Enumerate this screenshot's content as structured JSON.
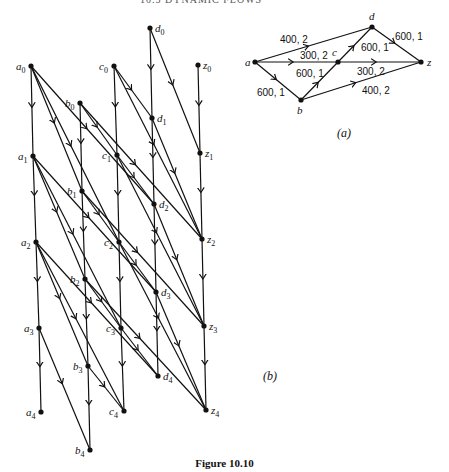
{
  "header": {
    "running_head": "10.5  DYNAMIC FLOWS"
  },
  "caption": "Figure 10.10",
  "panel_a": {
    "label": "(a)",
    "nodes": [
      {
        "id": "a",
        "label": "a",
        "x": 255,
        "y": 62,
        "lx": -10,
        "ly": 4
      },
      {
        "id": "b",
        "label": "b",
        "x": 301,
        "y": 100,
        "lx": -4,
        "ly": 14
      },
      {
        "id": "c",
        "label": "c",
        "x": 338,
        "y": 62,
        "lx": -6,
        "ly": -6
      },
      {
        "id": "d",
        "label": "d",
        "x": 372,
        "y": 27,
        "lx": -3,
        "ly": -7
      },
      {
        "id": "z",
        "label": "z",
        "x": 421,
        "y": 62,
        "lx": 6,
        "ly": 4
      }
    ],
    "edges": [
      {
        "from": "a",
        "to": "d",
        "label": "400, 2",
        "lx": 280,
        "ly": 43
      },
      {
        "from": "a",
        "to": "c",
        "label": "300, 2",
        "lx": 300,
        "ly": 59
      },
      {
        "from": "a",
        "to": "b",
        "label": "600, 1",
        "lx": 257,
        "ly": 96
      },
      {
        "from": "b",
        "to": "c",
        "label": "600, 1",
        "lx": 296,
        "ly": 77
      },
      {
        "from": "c",
        "to": "d",
        "label": "600, 1",
        "lx": 361,
        "ly": 51
      },
      {
        "from": "d",
        "to": "z",
        "label": "600, 1",
        "lx": 395,
        "ly": 40
      },
      {
        "from": "c",
        "to": "z",
        "label": "300, 2",
        "lx": 357,
        "ly": 75
      },
      {
        "from": "b",
        "to": "z",
        "label": "400, 2",
        "lx": 362,
        "ly": 94
      }
    ]
  },
  "panel_b": {
    "label": "(b)",
    "nodes": [
      {
        "id": "a0",
        "base": "a",
        "t": "0",
        "x": 31,
        "y": 66
      },
      {
        "id": "a1",
        "base": "a",
        "t": "1",
        "x": 33,
        "y": 156
      },
      {
        "id": "a2",
        "base": "a",
        "t": "2",
        "x": 36,
        "y": 242
      },
      {
        "id": "a3",
        "base": "a",
        "t": "3",
        "x": 39,
        "y": 328
      },
      {
        "id": "a4",
        "base": "a",
        "t": "4",
        "x": 41,
        "y": 412
      },
      {
        "id": "b0",
        "base": "b",
        "t": "0",
        "x": 80,
        "y": 103
      },
      {
        "id": "b1",
        "base": "b",
        "t": "1",
        "x": 82,
        "y": 191
      },
      {
        "id": "b2",
        "base": "b",
        "t": "2",
        "x": 85,
        "y": 279
      },
      {
        "id": "b3",
        "base": "b",
        "t": "3",
        "x": 88,
        "y": 366
      },
      {
        "id": "b4",
        "base": "b",
        "t": "4",
        "x": 90,
        "y": 450
      },
      {
        "id": "c0",
        "base": "c",
        "t": "0",
        "x": 114,
        "y": 66
      },
      {
        "id": "c1",
        "base": "c",
        "t": "1",
        "x": 117,
        "y": 155
      },
      {
        "id": "c2",
        "base": "c",
        "t": "2",
        "x": 119,
        "y": 242
      },
      {
        "id": "c3",
        "base": "c",
        "t": "3",
        "x": 121,
        "y": 328
      },
      {
        "id": "c4",
        "base": "c",
        "t": "4",
        "x": 124,
        "y": 411
      },
      {
        "id": "d0",
        "base": "d",
        "t": "0",
        "x": 150,
        "y": 28
      },
      {
        "id": "d1",
        "base": "d",
        "t": "1",
        "x": 152,
        "y": 118
      },
      {
        "id": "d2",
        "base": "d",
        "t": "2",
        "x": 154,
        "y": 204
      },
      {
        "id": "d3",
        "base": "d",
        "t": "3",
        "x": 156,
        "y": 292
      },
      {
        "id": "d4",
        "base": "d",
        "t": "4",
        "x": 158,
        "y": 376
      },
      {
        "id": "z0",
        "base": "z",
        "t": "0",
        "x": 198,
        "y": 65
      },
      {
        "id": "z1",
        "base": "z",
        "t": "1",
        "x": 200,
        "y": 153
      },
      {
        "id": "z2",
        "base": "z",
        "t": "2",
        "x": 202,
        "y": 239
      },
      {
        "id": "z3",
        "base": "z",
        "t": "3",
        "x": 204,
        "y": 326
      },
      {
        "id": "z4",
        "base": "z",
        "t": "4",
        "x": 206,
        "y": 410
      }
    ],
    "holdover_edges": [
      [
        "a0",
        "a1"
      ],
      [
        "a1",
        "a2"
      ],
      [
        "a2",
        "a3"
      ],
      [
        "a3",
        "a4"
      ],
      [
        "b0",
        "b1"
      ],
      [
        "b1",
        "b2"
      ],
      [
        "b2",
        "b3"
      ],
      [
        "b3",
        "b4"
      ],
      [
        "c0",
        "c1"
      ],
      [
        "c1",
        "c2"
      ],
      [
        "c2",
        "c3"
      ],
      [
        "c3",
        "c4"
      ],
      [
        "d0",
        "d1"
      ],
      [
        "d1",
        "d2"
      ],
      [
        "d2",
        "d3"
      ],
      [
        "d3",
        "d4"
      ],
      [
        "z0",
        "z1"
      ],
      [
        "z1",
        "z2"
      ],
      [
        "z2",
        "z3"
      ],
      [
        "z3",
        "z4"
      ]
    ],
    "transit_edges": [
      [
        "a0",
        "b1"
      ],
      [
        "a1",
        "b2"
      ],
      [
        "a2",
        "b3"
      ],
      [
        "a3",
        "b4"
      ],
      [
        "a0",
        "c2"
      ],
      [
        "a1",
        "c3"
      ],
      [
        "a2",
        "c4"
      ],
      [
        "a0",
        "d2"
      ],
      [
        "a1",
        "d3"
      ],
      [
        "a2",
        "d4"
      ],
      [
        "b0",
        "c1"
      ],
      [
        "b1",
        "c2"
      ],
      [
        "b2",
        "c3"
      ],
      [
        "b3",
        "c4"
      ],
      [
        "b0",
        "z2"
      ],
      [
        "b1",
        "z3"
      ],
      [
        "b2",
        "z4"
      ],
      [
        "c0",
        "d1"
      ],
      [
        "c1",
        "d2"
      ],
      [
        "c2",
        "d3"
      ],
      [
        "c3",
        "d4"
      ],
      [
        "c0",
        "z2"
      ],
      [
        "c1",
        "z3"
      ],
      [
        "c2",
        "z4"
      ],
      [
        "d0",
        "z1"
      ],
      [
        "d1",
        "z2"
      ],
      [
        "d2",
        "z3"
      ],
      [
        "d3",
        "z4"
      ]
    ]
  }
}
